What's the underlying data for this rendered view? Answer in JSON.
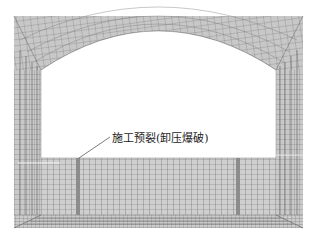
{
  "figure": {
    "annotation": {
      "label": "施工预裂(卸压爆破)",
      "target": "pre-split-strip-left"
    },
    "model": {
      "description": "Finite element mesh of an arched tunnel/chamber cross-section with floor pre-split slots",
      "components": [
        "arch-vault",
        "left-sidewall",
        "right-sidewall",
        "floor-block",
        "pre-split-strip-left",
        "pre-split-strip-right"
      ]
    },
    "colors": {
      "mesh_fill": "#c8c8c8",
      "mesh_line": "#555555",
      "strip_fill": "#8c8c8c",
      "opening_fill": "#ffffff",
      "floor_fill": "#d0d0d0",
      "text": "#1a1a1a"
    }
  }
}
